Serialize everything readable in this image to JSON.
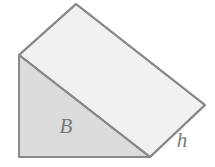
{
  "figure": {
    "name": "triangular-prism-wedge",
    "background_color": "#ffffff",
    "stroke_color": "#8a8a8a",
    "stroke_width": 2,
    "faces": {
      "base_triangle": {
        "label": "B",
        "fill_color": "#dcdcdc",
        "points": "19,55 19,157 150,157",
        "label_position": {
          "x": 66,
          "y": 128
        }
      },
      "top_slant": {
        "fill_color": "#f1f1f1",
        "points": "19,55 76,4 205,105 150,157"
      },
      "right_end": {
        "fill_color": "#ededed",
        "points": "150,157 205,105 205,105"
      }
    },
    "edges": {
      "left_vertical": "19,55 19,157",
      "bottom_horizontal": "19,157 150,157",
      "diagonal_hypotenuse": "19,55 150,157",
      "upper_left_slant": "19,55 76,4",
      "top_long_slant": "76,4 205,105",
      "slant_height_edge": "205,105 150,157"
    },
    "labels": [
      {
        "text": "B",
        "x": 66,
        "y": 128,
        "style": "italic"
      },
      {
        "text": "h",
        "x": 182,
        "y": 142,
        "style": "italic"
      }
    ]
  }
}
